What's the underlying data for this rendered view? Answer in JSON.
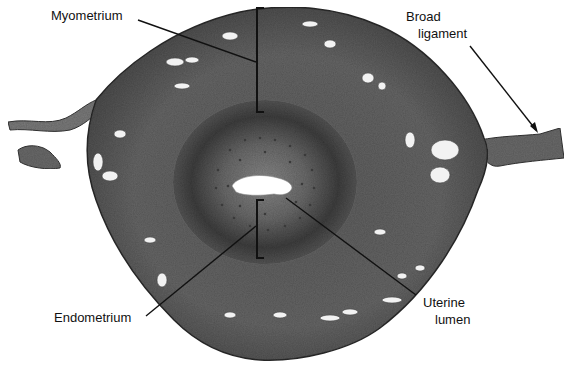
{
  "figure": {
    "labels": {
      "myometrium": "Myometrium",
      "broad_ligament_line1": "Broad",
      "broad_ligament_line2": "ligament",
      "endometrium": "Endometrium",
      "uterine_lumen_line1": "Uterine",
      "uterine_lumen_line2": "lumen"
    },
    "colors": {
      "background": "#ffffff",
      "tissue_outer": "#6e6e6e",
      "tissue_mid": "#5a5a5a",
      "endometrium_zone": "#4a4a4a",
      "endometrium_inner": "#7a7a7a",
      "lumen": "#ffffff",
      "leader_lines": "#111111"
    }
  }
}
